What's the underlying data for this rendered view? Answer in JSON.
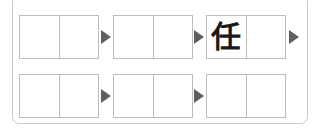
{
  "rows": [
    {
      "boxes": [
        {
          "cells": [
            "",
            ""
          ]
        },
        {
          "cells": [
            "",
            ""
          ]
        },
        {
          "cells": [
            "任",
            ""
          ]
        }
      ]
    },
    {
      "boxes": [
        {
          "cells": [
            "",
            ""
          ]
        },
        {
          "cells": [
            "",
            ""
          ]
        },
        {
          "cells": [
            "",
            ""
          ]
        }
      ]
    }
  ],
  "colors": {
    "arrow": "#5f5f5f",
    "box_border": "#bdbdbd",
    "frame_border": "#c8c8c8"
  }
}
